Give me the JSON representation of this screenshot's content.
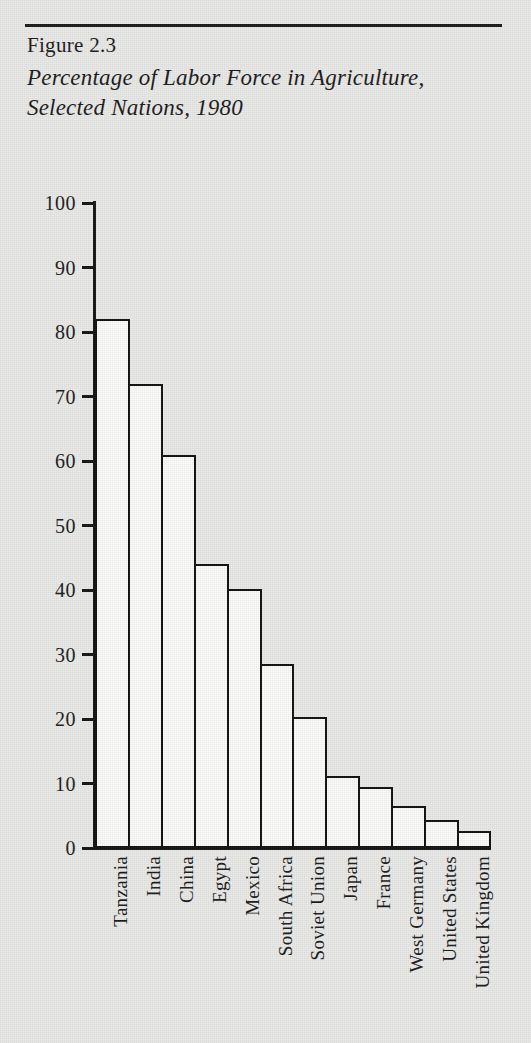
{
  "figure": {
    "number": "Figure 2.3",
    "title": "Percentage of Labor Force in Agriculture, Selected Nations, 1980"
  },
  "chart_data": {
    "type": "bar",
    "title": "Percentage of Labor Force in Agriculture, Selected Nations, 1980",
    "xlabel": "",
    "ylabel": "",
    "ylim": [
      0,
      100
    ],
    "ytick_labels": [
      "100",
      "90",
      "80",
      "70",
      "60",
      "50",
      "40",
      "30",
      "20",
      "10",
      "0"
    ],
    "ytick_values": [
      100,
      90,
      80,
      70,
      60,
      50,
      40,
      30,
      20,
      10,
      0
    ],
    "grid": false,
    "legend": "none",
    "bar_style": {
      "fill": "#fbfbfa",
      "edge": "#111111",
      "gap": "none"
    },
    "categories": [
      "Tanzania",
      "India",
      "China",
      "Egypt",
      "Mexico",
      "South Africa",
      "Soviet Union",
      "Japan",
      "France",
      "West Germany",
      "United States",
      "United Kingdom"
    ],
    "values": [
      82,
      72,
      61,
      44,
      40.2,
      28.5,
      20.3,
      11.2,
      9.4,
      6.5,
      4.4,
      2.6
    ]
  },
  "colors": {
    "paper": "#e9e9e7",
    "ink": "#151515",
    "bar_fill": "#fbfbfa"
  }
}
